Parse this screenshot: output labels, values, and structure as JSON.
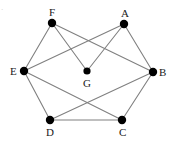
{
  "figure": {
    "type": "undirected-graph-diagram",
    "background_color": "#ffffff",
    "edge_color": "#808080",
    "node_color": "#000000",
    "label_color": "#1a1a1a",
    "corner_mark": "·",
    "width": 169,
    "height": 142
  },
  "nodes": [
    {
      "id": "A",
      "label": "A",
      "x": 124,
      "y": 24,
      "r": 4.2,
      "label_x": 121,
      "label_y": 8,
      "label_pos": "above"
    },
    {
      "id": "B",
      "label": "B",
      "x": 153,
      "y": 72,
      "r": 4.2,
      "label_x": 159,
      "label_y": 67,
      "label_pos": "right"
    },
    {
      "id": "C",
      "label": "C",
      "x": 122,
      "y": 120,
      "r": 4.2,
      "label_x": 119,
      "label_y": 127,
      "label_pos": "below"
    },
    {
      "id": "D",
      "label": "D",
      "x": 50,
      "y": 120,
      "r": 4.2,
      "label_x": 46,
      "label_y": 127,
      "label_pos": "below"
    },
    {
      "id": "E",
      "label": "E",
      "x": 24,
      "y": 71,
      "r": 4.2,
      "label_x": 10,
      "label_y": 66,
      "label_pos": "left"
    },
    {
      "id": "F",
      "label": "F",
      "x": 52,
      "y": 23,
      "r": 4.2,
      "label_x": 49,
      "label_y": 7,
      "label_pos": "above"
    },
    {
      "id": "G",
      "label": "G",
      "x": 87,
      "y": 71,
      "r": 3.6,
      "label_x": 83,
      "label_y": 78,
      "label_pos": "below"
    }
  ],
  "edges": [
    {
      "from": "F",
      "to": "E"
    },
    {
      "from": "F",
      "to": "G"
    },
    {
      "from": "F",
      "to": "B"
    },
    {
      "from": "A",
      "to": "E"
    },
    {
      "from": "A",
      "to": "G"
    },
    {
      "from": "A",
      "to": "B"
    },
    {
      "from": "E",
      "to": "D"
    },
    {
      "from": "E",
      "to": "C"
    },
    {
      "from": "D",
      "to": "B"
    },
    {
      "from": "D",
      "to": "C"
    },
    {
      "from": "C",
      "to": "B"
    }
  ]
}
